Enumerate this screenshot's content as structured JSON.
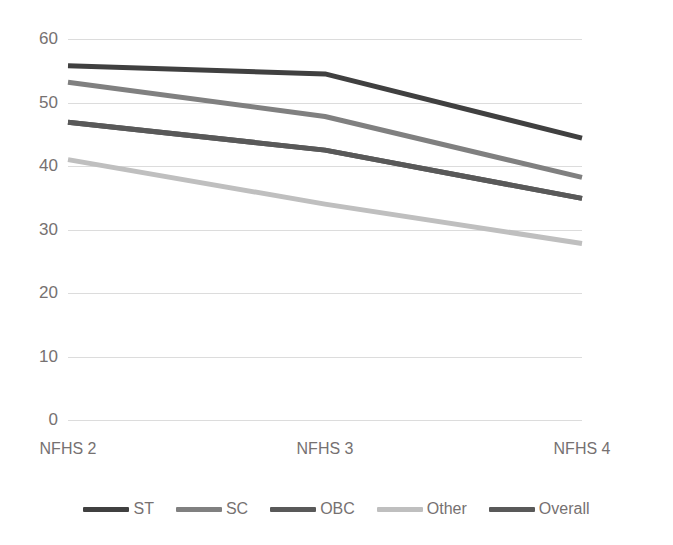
{
  "chart_data": {
    "type": "line",
    "title": "",
    "subtitle": "",
    "xlabel": "",
    "ylabel": "",
    "categories": [
      "NFHS 2",
      "NFHS 3",
      "NFHS 4"
    ],
    "ylim": [
      0,
      60
    ],
    "ytick_step": 10,
    "yticks": [
      60,
      50,
      40,
      30,
      20,
      10,
      0
    ],
    "grid": true,
    "legend_position": "bottom",
    "series": [
      {
        "name": "ST",
        "values": [
          55.8,
          54.5,
          44.4
        ],
        "color": "#404040"
      },
      {
        "name": "SC",
        "values": [
          53.2,
          47.8,
          38.2
        ],
        "color": "#808080"
      },
      {
        "name": "OBC",
        "values": [
          46.9,
          42.5,
          34.9
        ],
        "color": "#595959"
      },
      {
        "name": "Other",
        "values": [
          41.0,
          34.0,
          27.8
        ],
        "color": "#bfbfbf"
      },
      {
        "name": "Overall",
        "values": [
          46.9,
          42.5,
          34.9
        ],
        "color": "#595959"
      }
    ]
  },
  "axes": {
    "y_tick_labels": [
      "60",
      "50",
      "40",
      "30",
      "20",
      "10",
      "0"
    ],
    "x_tick_labels": [
      "NFHS 2",
      "NFHS 3",
      "NFHS 4"
    ]
  },
  "legend": {
    "items": [
      {
        "label": "ST",
        "color": "#404040"
      },
      {
        "label": "SC",
        "color": "#808080"
      },
      {
        "label": "OBC",
        "color": "#595959"
      },
      {
        "label": "Other",
        "color": "#bfbfbf"
      },
      {
        "label": "Overall",
        "color": "#595959"
      }
    ]
  },
  "style": {
    "background": "#ffffff",
    "gridline_color": "#dcdcdc",
    "text_color": "#767171"
  }
}
